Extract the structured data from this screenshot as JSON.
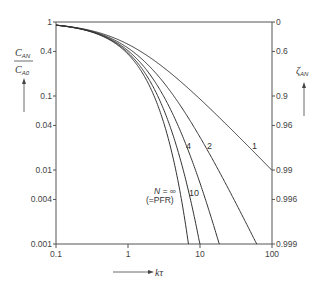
{
  "chart_data": {
    "type": "line",
    "title": "",
    "xlabel": "kτ",
    "ylabel_left": "C_AN / C_A0",
    "ylabel_right": "ζ_AN",
    "x_scale": "log",
    "y_scale": "log",
    "xlim": [
      0.1,
      100
    ],
    "ylim": [
      0.001,
      1
    ],
    "x_ticks": [
      "0.1",
      "1",
      "10",
      "100"
    ],
    "x_tick_values": [
      0.1,
      1,
      10,
      100
    ],
    "y_ticks_left": [
      "1",
      "0.4",
      "0.1",
      "0.04",
      "0.01",
      "0.004",
      "0.001"
    ],
    "y_tick_values_left": [
      1,
      0.4,
      0.1,
      0.04,
      0.01,
      0.004,
      0.001
    ],
    "y_ticks_right": [
      "0",
      "0.6",
      "0.9",
      "0.96",
      "0.99",
      "0.996",
      "0.999"
    ],
    "grid": false,
    "legend": "inline curve labels",
    "formula": "C_AN/C_A0 = (1 + kτ/N)^(-N); N=∞: exp(-kτ)",
    "series": [
      {
        "name": "1",
        "N": 1,
        "label": "1",
        "x": [
          0.1,
          0.3,
          1,
          3,
          10,
          30,
          100
        ],
        "values": [
          0.909,
          0.769,
          0.5,
          0.25,
          0.0909,
          0.0323,
          0.0099
        ]
      },
      {
        "name": "2",
        "N": 2,
        "label": "2",
        "x": [
          0.1,
          0.3,
          1,
          3,
          10,
          30,
          60
        ],
        "values": [
          0.907,
          0.756,
          0.444,
          0.16,
          0.0278,
          0.00346,
          0.00094
        ]
      },
      {
        "name": "4",
        "N": 4,
        "label": "4",
        "x": [
          0.1,
          0.3,
          1,
          3,
          10,
          17
        ],
        "values": [
          0.906,
          0.749,
          0.41,
          0.107,
          0.0081,
          0.00117
        ]
      },
      {
        "name": "10",
        "N": 10,
        "label": "10",
        "x": [
          0.1,
          0.3,
          1,
          3,
          6,
          10
        ],
        "values": [
          0.905,
          0.744,
          0.386,
          0.0725,
          0.0091,
          0.00098
        ]
      },
      {
        "name": "N = ∞ (=PFR)",
        "N": "inf",
        "label": "N = ∞ (=PFR)",
        "x": [
          0.1,
          0.3,
          1,
          3,
          5,
          6.9
        ],
        "values": [
          0.905,
          0.741,
          0.368,
          0.0498,
          0.00674,
          0.001
        ]
      }
    ]
  },
  "labels": {
    "left_axis_num": "C",
    "left_axis_num_sub": "AN",
    "left_axis_den": "C",
    "left_axis_den_sub": "A0",
    "right_axis": "ζ",
    "right_axis_sub": "AN",
    "x_axis": "kτ",
    "n_label_line1": "N = ∞",
    "n_label_line2": "(=PFR)",
    "curve_1": "1",
    "curve_2": "2",
    "curve_4": "4",
    "curve_10": "10"
  }
}
